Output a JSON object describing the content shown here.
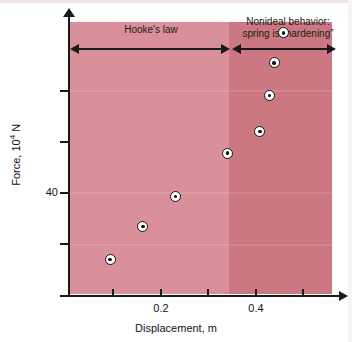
{
  "chart_data": {
    "type": "scatter",
    "title": "",
    "xlabel": "Displacement, m",
    "ylabel": "Force, 10⁴ N",
    "xlim": [
      0,
      0.583
    ],
    "ylim": [
      0,
      100
    ],
    "xticks": [
      0.2,
      0.4
    ],
    "xtick_labels": [
      "0.2",
      "0.4"
    ],
    "xticks_minor": [
      0.1,
      0.3,
      0.5
    ],
    "yticks": [
      40
    ],
    "ytick_labels": [
      "40"
    ],
    "yticks_minor": [
      20,
      60,
      80
    ],
    "grid": false,
    "legend": false,
    "series": [
      {
        "name": "measured spring response",
        "marker": "bullseye-circle",
        "x": [
          0.09,
          0.16,
          0.23,
          0.34,
          0.41,
          0.43,
          0.44,
          0.46
        ],
        "y": [
          13,
          25,
          36,
          52,
          60,
          73,
          85,
          96
        ]
      }
    ],
    "regions": [
      {
        "name": "hookes-law",
        "label": "Hooke's law",
        "x_range": [
          0,
          0.335
        ],
        "color": "#d9909a"
      },
      {
        "name": "nonideal-hardening",
        "label": "Nonideal behavior:\nspring is \"hardening\"",
        "x_range": [
          0.335,
          0.583
        ],
        "color": "#cc7883"
      }
    ],
    "annotations": {
      "hooke_label": "Hooke's law",
      "nonideal_label_line1": "Nonideal behavior:",
      "nonideal_label_line2": "spring is “hardening”"
    },
    "colors": {
      "band_linear": "#d9909a",
      "band_hardening": "#cc7883",
      "axis": "#1a1a1a",
      "marker_fill": "#ffffff",
      "marker_edge": "#111111",
      "background": "#ffffff"
    }
  },
  "axes": {
    "y_title_main": "Force, 10",
    "y_title_exp": "4",
    "y_title_unit": " N",
    "x_title": "Displacement, m"
  }
}
